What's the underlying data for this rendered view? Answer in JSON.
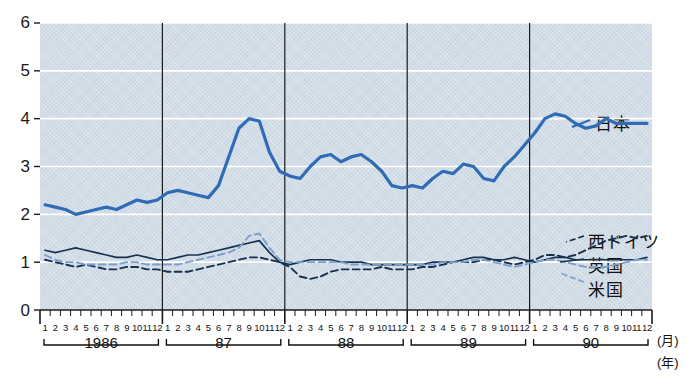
{
  "chart_data": {
    "type": "line",
    "title": "",
    "xlabel": "(月) / (年)",
    "ylabel": "",
    "ylim": [
      0,
      6
    ],
    "yticks": [
      "0",
      "1",
      "2",
      "3",
      "4",
      "5",
      "6"
    ],
    "grid": true,
    "legend_position": "right-inline-labels",
    "x_unit_label": "(月)",
    "year_unit_label": "(年)",
    "months": [
      "1",
      "2",
      "3",
      "4",
      "5",
      "6",
      "7",
      "8",
      "9",
      "10",
      "11",
      "12"
    ],
    "years": [
      "1986",
      "87",
      "88",
      "89",
      "90"
    ],
    "series": [
      {
        "name": "日本",
        "color": "#2f6cb5",
        "style": "solid-thick",
        "values": [
          2.2,
          2.15,
          2.1,
          2.0,
          2.05,
          2.1,
          2.15,
          2.1,
          2.2,
          2.3,
          2.25,
          2.3,
          2.45,
          2.5,
          2.45,
          2.4,
          2.35,
          2.6,
          3.2,
          3.8,
          4.0,
          3.95,
          3.3,
          2.9,
          2.8,
          2.75,
          3.0,
          3.2,
          3.25,
          3.1,
          3.2,
          3.25,
          3.1,
          2.9,
          2.6,
          2.55,
          2.6,
          2.55,
          2.75,
          2.9,
          2.85,
          3.05,
          3.0,
          2.75,
          2.7,
          3.0,
          3.2,
          3.45,
          3.7,
          4.0,
          4.1,
          4.05,
          3.9,
          3.8,
          3.85,
          4.0,
          3.9,
          3.9,
          3.9,
          3.9
        ]
      },
      {
        "name": "西ドイツ",
        "color": "#16304d",
        "style": "dashed-dark",
        "values": [
          1.05,
          1.0,
          0.95,
          0.9,
          0.95,
          0.9,
          0.85,
          0.85,
          0.9,
          0.9,
          0.85,
          0.85,
          0.8,
          0.8,
          0.8,
          0.85,
          0.9,
          0.95,
          1.0,
          1.05,
          1.1,
          1.1,
          1.05,
          1.0,
          0.9,
          0.7,
          0.65,
          0.7,
          0.8,
          0.85,
          0.85,
          0.85,
          0.85,
          0.9,
          0.85,
          0.85,
          0.85,
          0.9,
          0.9,
          0.95,
          1.0,
          1.0,
          1.0,
          1.05,
          1.05,
          1.0,
          0.95,
          1.0,
          1.05,
          1.15,
          1.15,
          1.1,
          1.15,
          1.25,
          1.35,
          1.45,
          1.5,
          1.55,
          1.5,
          1.55
        ]
      },
      {
        "name": "英国",
        "color": "#17334f",
        "style": "solid-thin",
        "values": [
          1.25,
          1.2,
          1.25,
          1.3,
          1.25,
          1.2,
          1.15,
          1.1,
          1.1,
          1.15,
          1.1,
          1.05,
          1.05,
          1.1,
          1.15,
          1.15,
          1.2,
          1.25,
          1.3,
          1.35,
          1.4,
          1.45,
          1.2,
          1.0,
          0.95,
          1.0,
          1.05,
          1.05,
          1.05,
          1.0,
          1.0,
          1.0,
          0.95,
          0.95,
          0.95,
          0.95,
          0.95,
          0.95,
          1.0,
          1.0,
          1.0,
          1.05,
          1.1,
          1.1,
          1.05,
          1.05,
          1.1,
          1.05,
          1.0,
          1.05,
          1.1,
          1.1,
          1.05,
          1.05,
          1.05,
          1.05,
          1.05,
          1.05,
          1.05,
          1.1
        ]
      },
      {
        "name": "米国",
        "color": "#7d9fcc",
        "style": "dashed-light",
        "values": [
          1.15,
          1.05,
          1.0,
          1.0,
          0.95,
          0.95,
          0.95,
          0.95,
          1.0,
          1.0,
          0.95,
          0.95,
          0.95,
          0.95,
          1.0,
          1.05,
          1.1,
          1.15,
          1.2,
          1.3,
          1.55,
          1.6,
          1.3,
          1.05,
          1.0,
          1.0,
          1.0,
          1.0,
          1.0,
          1.0,
          0.95,
          0.95,
          0.95,
          0.95,
          0.95,
          0.95,
          0.95,
          0.95,
          0.95,
          1.0,
          1.0,
          1.0,
          1.05,
          1.05,
          1.0,
          0.95,
          0.9,
          0.95,
          1.0,
          1.05,
          1.05,
          1.0,
          0.95,
          0.9,
          0.9,
          0.9,
          0.95,
          1.0,
          1.05,
          1.05
        ]
      }
    ]
  },
  "axis": {
    "y_ticks": [
      "6",
      "5",
      "4",
      "3",
      "2",
      "1",
      "0"
    ],
    "month_label": "(月)",
    "year_label": "(年)"
  },
  "labels": {
    "japan": "日本",
    "west_germany": "西ドイツ",
    "uk": "英国",
    "usa": "米国"
  },
  "colors": {
    "plot_background": "#d3dde7",
    "gridline": "#ffffff",
    "japan_line": "#2f6cb5",
    "usa_line": "#7d9fcc",
    "uk_line": "#17334f",
    "west_germany_line": "#16304d"
  }
}
